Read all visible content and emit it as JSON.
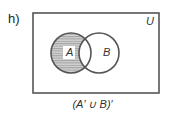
{
  "part_label": "h)",
  "universe_label": "U",
  "sets": [
    {
      "label": "A",
      "shaded": true
    },
    {
      "label": "B",
      "shaded": false
    }
  ],
  "caption": "(A′ ∪ B)′",
  "colors": {
    "outline": "#555555",
    "shade": "#c8c8c8",
    "hatch": "#888888"
  }
}
